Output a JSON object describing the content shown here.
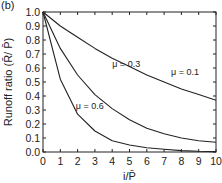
{
  "chart_data": {
    "type": "line",
    "panel_label": "(b)",
    "title": "",
    "xlabel": "i/P̄",
    "ylabel": "Runoff ratio (R̄/ P̄)",
    "xlim": [
      0,
      10
    ],
    "ylim": [
      0.0,
      1.0
    ],
    "x_ticks": [
      "0",
      "1",
      "2",
      "3",
      "4",
      "5",
      "6",
      "7",
      "8",
      "9",
      "10"
    ],
    "y_ticks": [
      "0.0",
      "0.1",
      "0.2",
      "0.3",
      "0.4",
      "0.5",
      "0.6",
      "0.7",
      "0.8",
      "0.9",
      "1.0"
    ],
    "grid": false,
    "legend": "inline labels",
    "x": [
      0,
      1,
      2,
      3,
      4,
      5,
      6,
      7,
      8,
      9,
      10
    ],
    "series": [
      {
        "name": "μ = 0.1",
        "values": [
          1.0,
          0.9,
          0.82,
          0.74,
          0.67,
          0.61,
          0.55,
          0.5,
          0.45,
          0.41,
          0.37
        ]
      },
      {
        "name": "μ = 0.3",
        "values": [
          1.0,
          0.74,
          0.55,
          0.41,
          0.31,
          0.23,
          0.17,
          0.13,
          0.1,
          0.08,
          0.07
        ]
      },
      {
        "name": "μ = 0.6",
        "values": [
          1.0,
          0.52,
          0.27,
          0.15,
          0.08,
          0.05,
          0.03,
          0.02,
          0.01,
          0.005,
          0.003
        ]
      }
    ],
    "annotations": [
      {
        "text": "μ = 0.1",
        "x": 7.4,
        "y": 0.55
      },
      {
        "text": "μ = 0.3",
        "x": 4.0,
        "y": 0.61
      },
      {
        "text": "μ = 0.6",
        "x": 1.9,
        "y": 0.31
      }
    ]
  }
}
